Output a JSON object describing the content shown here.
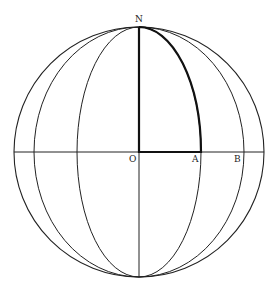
{
  "diagram": {
    "type": "globe-meridians",
    "labels": {
      "north": "N",
      "origin": "O",
      "point_a": "A",
      "point_b": "B"
    },
    "geometry": {
      "center": [
        139,
        152
      ],
      "radius": 125,
      "meridian_rx": [
        62,
        105,
        125
      ],
      "highlight": "quarter region N-O-A bounded by meridian through A"
    },
    "colors": {
      "line": "#222222",
      "background": "#ffffff"
    }
  }
}
